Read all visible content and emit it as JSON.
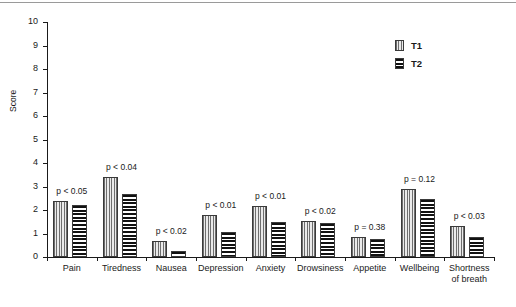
{
  "chart_data": {
    "type": "bar",
    "title": "",
    "xlabel": "",
    "ylabel": "Score",
    "ylim": [
      0,
      10
    ],
    "ytick_step": 1,
    "yticks": [
      "0",
      "1",
      "2",
      "3",
      "4",
      "5",
      "6",
      "7",
      "8",
      "9",
      "10"
    ],
    "grid": false,
    "legend_position": "top-right",
    "categories": [
      "Pain",
      "Tiredness",
      "Nausea",
      "Depression",
      "Anxiety",
      "Drowsiness",
      "Appetite",
      "Wellbeing",
      "Shortness\nof breath"
    ],
    "series": [
      {
        "name": "T1",
        "pattern": "vertical-hatch",
        "color": "#d2d2d2",
        "values": [
          2.4,
          3.4,
          0.7,
          1.8,
          2.15,
          1.55,
          0.85,
          2.9,
          1.3
        ]
      },
      {
        "name": "T2",
        "pattern": "horizontal-hatch",
        "color": "#111111",
        "values": [
          2.2,
          2.7,
          0.25,
          1.05,
          1.5,
          1.45,
          0.75,
          2.45,
          0.85
        ]
      }
    ],
    "annotations": [
      "p < 0.05",
      "p < 0.04",
      "p < 0.02",
      "p < 0.01",
      "p < 0.01",
      "p < 0.02",
      "p = 0.38",
      "p = 0.12",
      "p < 0.03"
    ]
  },
  "legend": {
    "items": [
      {
        "label": "T1"
      },
      {
        "label": "T2"
      }
    ]
  }
}
